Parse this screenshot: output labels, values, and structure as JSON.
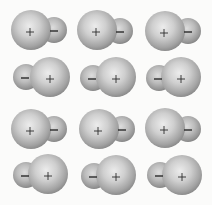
{
  "diagram": {
    "rows": 4,
    "columns": 3,
    "colors": {
      "background": "#fbfbfa",
      "sphere_light": "#e6e6e6",
      "sphere_mid": "#bdbdbd",
      "sphere_dark": "#8a8a8a",
      "sign": "#2a2a2a"
    },
    "molecules": [
      {
        "row": 0,
        "col": 0,
        "orientation": "plus-left",
        "large": {
          "cx": 31,
          "cy": 30,
          "r": 20,
          "sign": "+"
        },
        "small": {
          "cx": 54,
          "cy": 30,
          "r": 13,
          "sign": "−"
        }
      },
      {
        "row": 0,
        "col": 1,
        "orientation": "plus-left",
        "large": {
          "cx": 97,
          "cy": 30,
          "r": 20,
          "sign": "+"
        },
        "small": {
          "cx": 120,
          "cy": 31,
          "r": 13,
          "sign": "−"
        }
      },
      {
        "row": 0,
        "col": 2,
        "orientation": "plus-left",
        "large": {
          "cx": 165,
          "cy": 31,
          "r": 20,
          "sign": "+"
        },
        "small": {
          "cx": 188,
          "cy": 31,
          "r": 13,
          "sign": "−"
        }
      },
      {
        "row": 1,
        "col": 0,
        "orientation": "minus-left",
        "small": {
          "cx": 26,
          "cy": 77,
          "r": 13,
          "sign": "−"
        },
        "large": {
          "cx": 50,
          "cy": 77,
          "r": 20,
          "sign": "+"
        }
      },
      {
        "row": 1,
        "col": 1,
        "orientation": "minus-left",
        "small": {
          "cx": 93,
          "cy": 78,
          "r": 13,
          "sign": "−"
        },
        "large": {
          "cx": 116,
          "cy": 77,
          "r": 20,
          "sign": "+"
        }
      },
      {
        "row": 1,
        "col": 2,
        "orientation": "minus-left",
        "small": {
          "cx": 159,
          "cy": 78,
          "r": 13,
          "sign": "−"
        },
        "large": {
          "cx": 181,
          "cy": 77,
          "r": 20,
          "sign": "+"
        }
      },
      {
        "row": 2,
        "col": 0,
        "orientation": "plus-left",
        "large": {
          "cx": 31,
          "cy": 129,
          "r": 20,
          "sign": "+"
        },
        "small": {
          "cx": 54,
          "cy": 129,
          "r": 13,
          "sign": "−"
        }
      },
      {
        "row": 2,
        "col": 1,
        "orientation": "plus-left",
        "large": {
          "cx": 99,
          "cy": 129,
          "r": 20,
          "sign": "+"
        },
        "small": {
          "cx": 122,
          "cy": 129,
          "r": 13,
          "sign": "−"
        }
      },
      {
        "row": 2,
        "col": 2,
        "orientation": "plus-left",
        "large": {
          "cx": 165,
          "cy": 128,
          "r": 20,
          "sign": "+"
        },
        "small": {
          "cx": 188,
          "cy": 129,
          "r": 13,
          "sign": "−"
        }
      },
      {
        "row": 3,
        "col": 0,
        "orientation": "minus-left",
        "small": {
          "cx": 26,
          "cy": 175,
          "r": 13,
          "sign": "−"
        },
        "large": {
          "cx": 48,
          "cy": 174,
          "r": 20,
          "sign": "+"
        }
      },
      {
        "row": 3,
        "col": 1,
        "orientation": "minus-left",
        "small": {
          "cx": 94,
          "cy": 176,
          "r": 13,
          "sign": "−"
        },
        "large": {
          "cx": 116,
          "cy": 175,
          "r": 20,
          "sign": "+"
        }
      },
      {
        "row": 3,
        "col": 2,
        "orientation": "minus-left",
        "small": {
          "cx": 160,
          "cy": 175,
          "r": 13,
          "sign": "−"
        },
        "large": {
          "cx": 182,
          "cy": 175,
          "r": 20,
          "sign": "+"
        }
      }
    ]
  }
}
